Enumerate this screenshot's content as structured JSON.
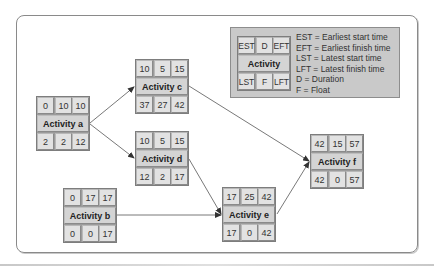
{
  "diagram": {
    "type": "activity-on-node network",
    "legend": {
      "node": {
        "est": "EST",
        "d": "D",
        "eft": "EFT",
        "label": "Activity",
        "lst": "LST",
        "f": "F",
        "lft": "LFT"
      },
      "lines": [
        "EST = Earliest start time",
        "EFT = Earliest finish time",
        "LST = Latest start time",
        "LFT = Latest finish time",
        "D = Duration",
        "F = Float"
      ]
    },
    "nodes": {
      "a": {
        "label": "Activity a",
        "est": "0",
        "d": "10",
        "eft": "10",
        "lst": "2",
        "f": "2",
        "lft": "12"
      },
      "b": {
        "label": "Activity b",
        "est": "0",
        "d": "17",
        "eft": "17",
        "lst": "0",
        "f": "0",
        "lft": "17"
      },
      "c": {
        "label": "Activity c",
        "est": "10",
        "d": "5",
        "eft": "15",
        "lst": "37",
        "f": "27",
        "lft": "42"
      },
      "d": {
        "label": "Activity d",
        "est": "10",
        "d": "5",
        "eft": "15",
        "lst": "12",
        "f": "2",
        "lft": "17"
      },
      "e": {
        "label": "Activity e",
        "est": "17",
        "d": "25",
        "eft": "42",
        "lst": "17",
        "f": "0",
        "lft": "42"
      },
      "f": {
        "label": "Activity f",
        "est": "42",
        "d": "15",
        "eft": "57",
        "lst": "42",
        "f": "0",
        "lft": "57"
      }
    },
    "edges": [
      {
        "from": "a",
        "to": "c"
      },
      {
        "from": "a",
        "to": "d"
      },
      {
        "from": "c",
        "to": "f"
      },
      {
        "from": "d",
        "to": "e"
      },
      {
        "from": "b",
        "to": "e"
      },
      {
        "from": "e",
        "to": "f"
      }
    ],
    "colors": {
      "cell": "#e2e2e2",
      "label_cell": "#d4d4d4",
      "node_border": "#7d7d7d",
      "legend_bg": "#c9c9c9",
      "edge": "#555555"
    }
  }
}
